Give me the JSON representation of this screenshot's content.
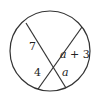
{
  "diagram": {
    "type": "intersecting-chords",
    "circle": {
      "cx": 50,
      "cy": 51,
      "r": 40,
      "stroke": "#333333"
    },
    "chords": [
      {
        "name": "chord-1",
        "x1": 26,
        "y1": 23,
        "x2": 66,
        "y2": 88
      },
      {
        "name": "chord-2",
        "x1": 38,
        "y1": 89,
        "x2": 82,
        "y2": 27
      }
    ],
    "labels": {
      "upper_left": "7",
      "lower_left": "4",
      "upper_right_var": "a",
      "upper_right_rest": " + 3",
      "lower_right": "a"
    }
  }
}
